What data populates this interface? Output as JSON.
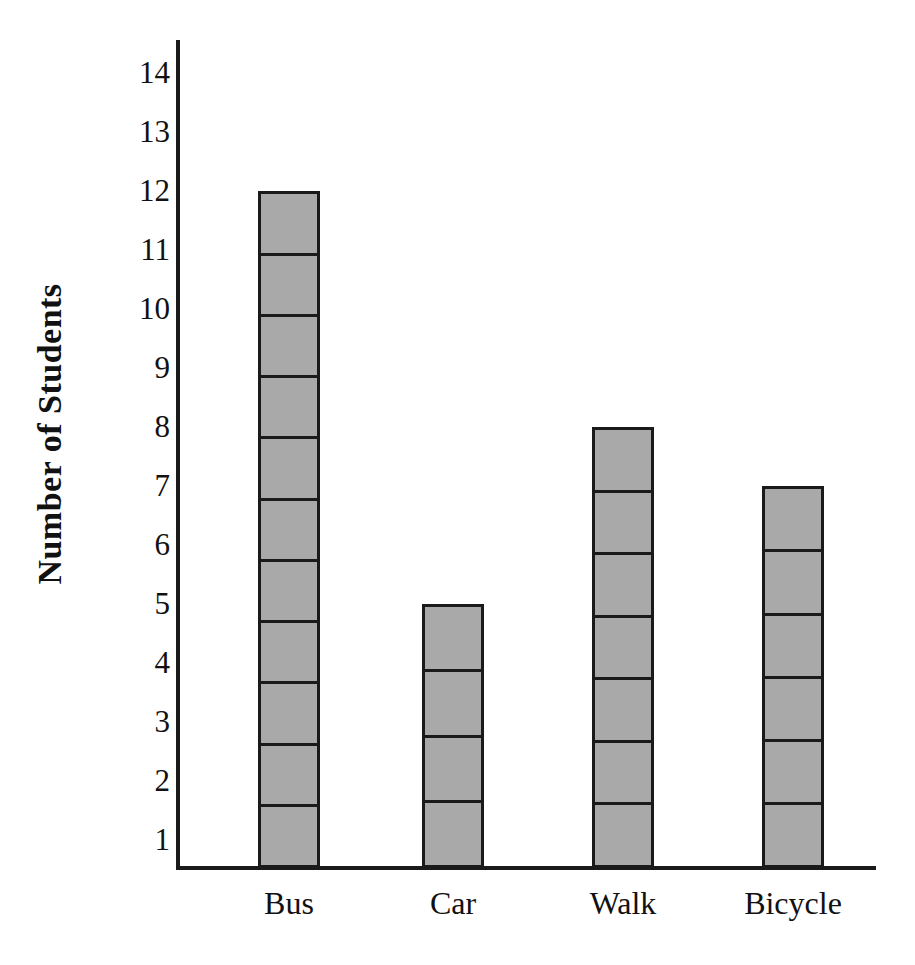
{
  "chart_data": {
    "type": "bar",
    "title": "",
    "subtitle": "",
    "xlabel": "",
    "ylabel": "Number of Students",
    "categories": [
      "Bus",
      "Car",
      "Walk",
      "Bicycle"
    ],
    "values": [
      11,
      4,
      7,
      6
    ],
    "series": [
      {
        "name": "Number of Students",
        "values": [
          11,
          4,
          7,
          6
        ]
      }
    ],
    "ylim": [
      0,
      14
    ],
    "y_ticks": [
      14,
      13,
      12,
      11,
      10,
      9,
      8,
      7,
      6,
      5,
      4,
      3,
      2,
      1
    ],
    "y_tick_labels": [
      "14",
      "13",
      "12",
      "11",
      "10",
      "9",
      "8",
      "7",
      "6",
      "5",
      "4",
      "3",
      "2",
      "1"
    ],
    "grid": false,
    "legend": false,
    "legend_position": "none",
    "annotations": [],
    "bar_style": {
      "fill_color": "#a9a9a9",
      "edge_color": "#1a1a1a",
      "segmented": true,
      "segment_unit": 1
    },
    "axis_color": "#1a1a1a",
    "background_color": "#ffffff"
  },
  "axes": {
    "y_title": "Number of Students",
    "y_ticks": [
      "14",
      "13",
      "12",
      "11",
      "10",
      "9",
      "8",
      "7",
      "6",
      "5",
      "4",
      "3",
      "2",
      "1"
    ],
    "x_ticks": [
      "Bus",
      "Car",
      "Walk",
      "Bicycle"
    ]
  }
}
